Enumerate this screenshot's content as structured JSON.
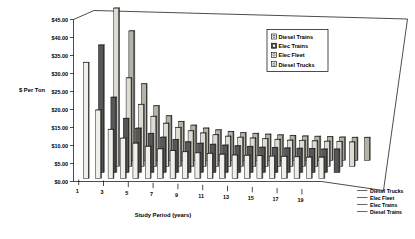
{
  "chart_data": {
    "type": "bar",
    "title": "",
    "subtitle": "",
    "xlabel": "Study Period (years)",
    "ylabel": "$ Per Ton",
    "ylim": [
      0,
      45
    ],
    "ytick_labels": [
      "$0.00",
      "$5.00",
      "$10.00",
      "$15.00",
      "$20.00",
      "$25.00",
      "$30.00",
      "$35.00",
      "$40.00",
      "$45.00"
    ],
    "ytick_values": [
      0,
      5,
      10,
      15,
      20,
      25,
      30,
      35,
      40,
      45
    ],
    "grid": false,
    "projection": "3d",
    "legend_position": "top-right",
    "categories": [
      1,
      2,
      3,
      4,
      5,
      6,
      7,
      8,
      9,
      10,
      11,
      12,
      13,
      14,
      15,
      16,
      17,
      18,
      19,
      20
    ],
    "xtick_labels": [
      "1",
      "3",
      "5",
      "7",
      "9",
      "11",
      "13",
      "15",
      "17",
      "19"
    ],
    "xtick_categories": [
      1,
      3,
      5,
      7,
      9,
      11,
      13,
      15,
      17,
      19
    ],
    "series": [
      {
        "name": "Diesel Trains",
        "fill": "#f0efe9",
        "values": [
          32.2,
          19.0,
          13.6,
          11.2,
          9.8,
          8.9,
          8.2,
          7.7,
          7.4,
          7.1,
          6.9,
          6.7,
          6.5,
          6.4,
          6.3,
          6.2,
          6.1,
          6.0,
          5.9,
          5.9
        ]
      },
      {
        "name": "Elec Trains",
        "fill": "#575757",
        "values": [
          35.4,
          20.9,
          15.0,
          12.3,
          10.8,
          9.8,
          9.1,
          8.5,
          8.1,
          7.8,
          7.6,
          7.4,
          7.2,
          7.0,
          6.9,
          6.8,
          6.7,
          6.6,
          6.5,
          6.5
        ]
      },
      {
        "name": "Elec Fleet",
        "fill": "#dedbd2",
        "values": [
          44.0,
          24.6,
          17.2,
          13.9,
          12.0,
          10.8,
          9.9,
          9.3,
          8.8,
          8.4,
          8.1,
          7.9,
          7.7,
          7.5,
          7.3,
          7.2,
          7.1,
          7.0,
          6.9,
          6.8
        ]
      },
      {
        "name": "Diesel Trucks",
        "fill": "#b5b2a8",
        "values": [
          36.0,
          21.3,
          15.2,
          12.4,
          10.8,
          9.8,
          9.0,
          8.5,
          8.0,
          7.7,
          7.5,
          7.3,
          7.1,
          6.9,
          6.8,
          6.7,
          6.6,
          6.5,
          6.4,
          6.4
        ]
      }
    ]
  },
  "legend": {
    "items": [
      {
        "label": "Diesel Trains",
        "swatch": "#ffffff"
      },
      {
        "label": "Elec Trains",
        "swatch": "#4a4a4a"
      },
      {
        "label": "Elec Fleet",
        "swatch": "#ffffff"
      },
      {
        "label": "Diesel Trucks",
        "swatch": "#ffffff"
      }
    ]
  },
  "depth_labels": [
    {
      "label": "Diesel Trucks"
    },
    {
      "label": "Elec Fleet"
    },
    {
      "label": "Elec Trains"
    },
    {
      "label": "Diesel Trains"
    }
  ]
}
